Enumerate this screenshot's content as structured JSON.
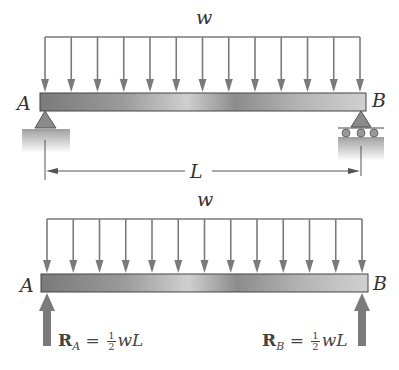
{
  "top_diagram": {
    "load_label": "w",
    "support_left_label": "A",
    "support_right_label": "B",
    "span_label": "L",
    "arrow_count": 13,
    "left_support": "pin",
    "right_support": "roller"
  },
  "bottom_diagram": {
    "load_label": "w",
    "left_label": "A",
    "right_label": "B",
    "arrow_count": 13,
    "reaction_a": {
      "symbol": "R",
      "subscript": "A",
      "equals": "=",
      "frac_num": "1",
      "frac_den": "2",
      "rest": "wL"
    },
    "reaction_b": {
      "symbol": "R",
      "subscript": "B",
      "equals": "=",
      "frac_num": "1",
      "frac_den": "2",
      "rest": "wL"
    }
  },
  "colors": {
    "arrow": "#7a7a7a",
    "beam_dark": "#6e6e6e",
    "beam_light": "#d8d8d8",
    "text": "#333333"
  }
}
